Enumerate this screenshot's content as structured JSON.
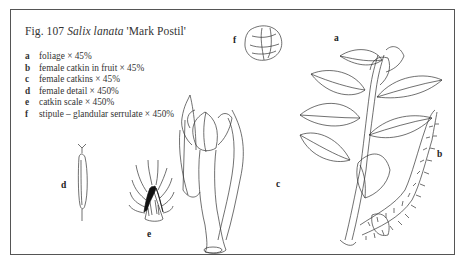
{
  "figure": {
    "number": "Fig. 107",
    "species": "Salix lanata",
    "cultivar": "'Mark Postil'"
  },
  "legend": [
    {
      "key": "a",
      "text": "foliage × 45%"
    },
    {
      "key": "b",
      "text": "female catkin in fruit × 45%"
    },
    {
      "key": "c",
      "text": "female catkins × 45%"
    },
    {
      "key": "d",
      "text": "female detail × 450%"
    },
    {
      "key": "e",
      "text": "catkin scale × 450%"
    },
    {
      "key": "f",
      "text": "stipule – glandular serrulate × 450%"
    }
  ],
  "labels": {
    "a": "a",
    "b": "b",
    "c": "c",
    "d": "d",
    "e": "e",
    "f": "f"
  },
  "colors": {
    "ink": "#333333",
    "frame": "#555555",
    "background": "#ffffff"
  }
}
